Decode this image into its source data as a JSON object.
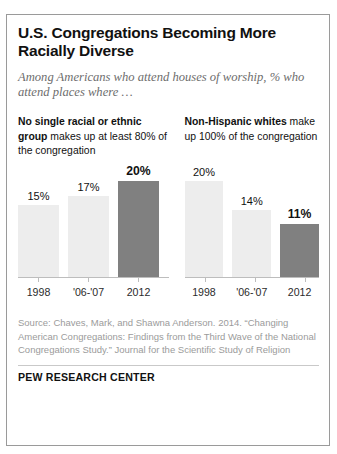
{
  "title": "U.S. Congregations Becoming More Racially Diverse",
  "subtitle": "Among Americans who attend houses of worship, % who attend places where …",
  "panels": {
    "left": {
      "head_bold": "No single racial or ethnic group",
      "head_rest": " makes up at least 80% of the congregation"
    },
    "right": {
      "head_bold": "Non-Hispanic whites",
      "head_rest": " make up 100% of the congregation"
    }
  },
  "source": "Source: Chaves, Mark, and Shawna Anderson. 2014. “Changing American Congregations: Findings from the Third Wave of the National Congregations Study.” Journal for the Scientific Study of Religion",
  "footer": "PEW RESEARCH CENTER",
  "colors": {
    "bar_light": "#ededed",
    "bar_highlight": "#808080",
    "text": "#111111",
    "muted": "#9b9b9b"
  },
  "chart_data": [
    {
      "type": "bar",
      "title": "No single racial or ethnic group makes up at least 80% of the congregation",
      "categories": [
        "1998",
        "'06-'07",
        "2012"
      ],
      "values": [
        15,
        17,
        20
      ],
      "labels": [
        "15%",
        "17%",
        "20%"
      ],
      "highlight_index": 2,
      "xlabel": "",
      "ylabel": "%",
      "ylim": [
        0,
        20
      ],
      "grid": false,
      "legend": "none"
    },
    {
      "type": "bar",
      "title": "Non-Hispanic whites make up 100% of the congregation",
      "categories": [
        "1998",
        "'06-'07",
        "2012"
      ],
      "values": [
        20,
        14,
        11
      ],
      "labels": [
        "20%",
        "14%",
        "11%"
      ],
      "highlight_index": 2,
      "xlabel": "",
      "ylabel": "%",
      "ylim": [
        0,
        20
      ],
      "grid": false,
      "legend": "none"
    }
  ]
}
